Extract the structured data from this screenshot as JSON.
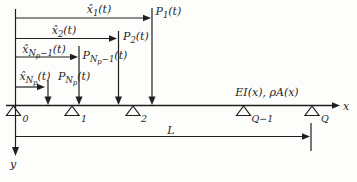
{
  "diagram": {
    "colors": {
      "background": "#fdfdfb",
      "ink": "#1f1f1f"
    },
    "beam_property_label": "EI(x), ρA(x)",
    "axis": {
      "x_label": "x",
      "y_label": "y"
    },
    "length": {
      "label": "L"
    },
    "loads": [
      {
        "name": "P1",
        "pos": [
          {
            "t": "x̂"
          },
          {
            "t": "1",
            "lvl": 1
          },
          {
            "t": "(t)"
          }
        ],
        "force": [
          {
            "t": "P"
          },
          {
            "t": "1",
            "lvl": 1
          },
          {
            "t": "(t)"
          }
        ]
      },
      {
        "name": "P2",
        "pos": [
          {
            "t": "x̂"
          },
          {
            "t": "2",
            "lvl": 1
          },
          {
            "t": "(t)"
          }
        ],
        "force": [
          {
            "t": "P"
          },
          {
            "t": "2",
            "lvl": 1
          },
          {
            "t": "(t)"
          }
        ]
      },
      {
        "name": "PNp-1",
        "pos": [
          {
            "t": "x̂"
          },
          {
            "t": "N",
            "lvl": 1
          },
          {
            "t": "p",
            "lvl": 2
          },
          {
            "t": "−1",
            "lvl": 1
          },
          {
            "t": "(t)"
          }
        ],
        "force": [
          {
            "t": "P"
          },
          {
            "t": "N",
            "lvl": 1
          },
          {
            "t": "p",
            "lvl": 2
          },
          {
            "t": "−1",
            "lvl": 1
          },
          {
            "t": "(t)"
          }
        ]
      },
      {
        "name": "PNp",
        "pos": [
          {
            "t": "x̂"
          },
          {
            "t": "N",
            "lvl": 1
          },
          {
            "t": "p",
            "lvl": 2
          },
          {
            "t": "(t)"
          }
        ],
        "force": [
          {
            "t": "P"
          },
          {
            "t": "N",
            "lvl": 1
          },
          {
            "t": "p",
            "lvl": 2
          },
          {
            "t": "(t)"
          }
        ]
      }
    ],
    "supports": [
      {
        "label": "0"
      },
      {
        "label": "1"
      },
      {
        "label": "2"
      },
      {
        "label": "Q−1"
      },
      {
        "label": "Q"
      }
    ]
  }
}
